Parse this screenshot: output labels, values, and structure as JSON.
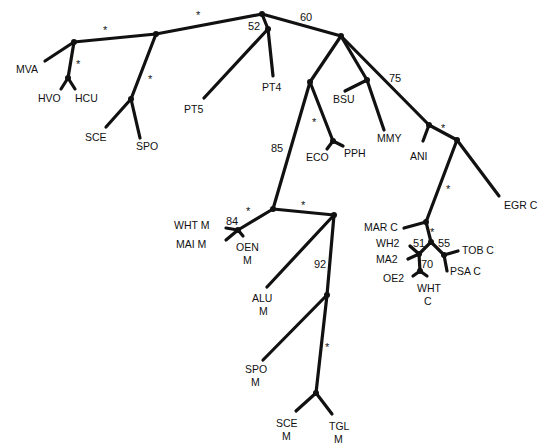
{
  "diagram": {
    "type": "unrooted phylogenetic tree",
    "taxa": {
      "MVA": "MVA",
      "HVO": "HVO",
      "HCU": "HCU",
      "SCE": "SCE",
      "SPO": "SPO",
      "PT5": "PT5",
      "PT4": "PT4",
      "BSU": "BSU",
      "MMY": "MMY",
      "ECO": "ECO",
      "PPH": "PPH",
      "ANI": "ANI",
      "EGR_C": "EGR C",
      "MAR_C": "MAR C",
      "WH2": "WH2",
      "MA2": "MA2",
      "OE2": "OE2",
      "WHT_C_1": "WHT",
      "WHT_C_2": "C",
      "TOB_C": "TOB C",
      "PSA_C": "PSA C",
      "WHT_M": "WHT M",
      "MAI_M": "MAI M",
      "OEN_M_1": "OEN",
      "OEN_M_2": "M",
      "ALU_M_1": "ALU",
      "ALU_M_2": "M",
      "SPO_M_1": "SPO",
      "SPO_M_2": "M",
      "SCE_M_1": "SCE",
      "SCE_M_2": "M",
      "TGL_M_1": "TGL",
      "TGL_M_2": "M"
    },
    "support": {
      "s_top_left": "*",
      "s_top_mid": "*",
      "s_hvo": "*",
      "s_sce": "*",
      "v60": "60",
      "v52": "52",
      "v75": "75",
      "s_eco": "*",
      "v85": "85",
      "s_ani": "*",
      "s_egr": "*",
      "s_mar": "*",
      "v51": "51",
      "v55": "55",
      "v70": "70",
      "v84": "84",
      "s_oen": "*",
      "s_mito": "*",
      "v92": "92",
      "s_spo_m": "*"
    }
  }
}
